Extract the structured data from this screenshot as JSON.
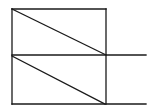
{
  "diagram": {
    "stroke_color": "#1a1a1a",
    "background": "#ffffff",
    "stroke_width": 1.3,
    "shapes": {
      "upper_rect": {
        "x1": 12,
        "y1": 9,
        "x2": 106,
        "y2": 55
      },
      "lower_rect": {
        "x1": 12,
        "y1": 55,
        "x2": 106,
        "y2": 104
      },
      "mid_extension": {
        "x1": 106,
        "y1": 55,
        "x2": 146,
        "y2": 55
      },
      "bottom_extension": {
        "x1": 106,
        "y1": 104,
        "x2": 146,
        "y2": 104
      },
      "upper_diagonal": {
        "x1": 12,
        "y1": 9,
        "x2": 106,
        "y2": 55
      },
      "lower_diagonal": {
        "x1": 12,
        "y1": 56,
        "x2": 105,
        "y2": 104
      }
    }
  }
}
